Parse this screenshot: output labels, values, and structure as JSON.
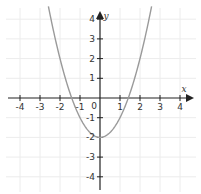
{
  "chart_data": {
    "type": "line",
    "title": "",
    "xlabel": "x",
    "ylabel": "y",
    "xlim": [
      -4.5,
      4.6
    ],
    "ylim": [
      -4.6,
      4.4
    ],
    "x_ticks": [
      -4,
      -3,
      -2,
      -1,
      1,
      2,
      3,
      4
    ],
    "y_ticks": [
      -4,
      -3,
      -2,
      -1,
      1,
      2,
      3,
      4
    ],
    "origin_label": "0",
    "grid": true,
    "legend": null,
    "series": [
      {
        "name": "y = x^2 - 2",
        "function": "x^2 - 2",
        "x": [
          -2.55,
          -2.0,
          -1.5,
          -1.414,
          -1.0,
          -0.5,
          0,
          0.5,
          1.0,
          1.414,
          1.5,
          2.0,
          2.55
        ],
        "y": [
          4.5,
          2.0,
          0.25,
          0,
          -1.0,
          -1.75,
          -2.0,
          -1.75,
          -1.0,
          0,
          0.25,
          2.0,
          4.5
        ],
        "vertex": [
          0,
          -2
        ],
        "x_intercepts": [
          -1.414,
          1.414
        ],
        "color": "#9a9a9a"
      }
    ]
  },
  "colors": {
    "axis": "#222222",
    "grid": "#ececec",
    "curve": "#9a9a9a",
    "background": "#ffffff"
  }
}
